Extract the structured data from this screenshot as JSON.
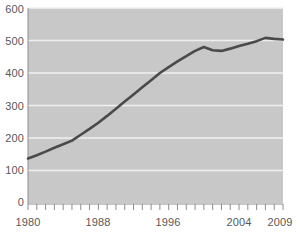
{
  "chart_data": {
    "type": "line",
    "title": "",
    "subtitle": "",
    "xlabel": "",
    "ylabel": "",
    "xlim": [
      1980,
      2009
    ],
    "ylim": [
      0,
      600
    ],
    "grid": true,
    "grid_axis": "y",
    "legend": false,
    "legend_position": "none",
    "plot_background": "#c8c8c8",
    "line_color": "#4a4a4a",
    "grid_color": "#f0f0f0",
    "axis_color": "#8c8c8c",
    "text_color": "#58585a",
    "x": [
      1980,
      1981,
      1982,
      1983,
      1984,
      1985,
      1986,
      1987,
      1988,
      1989,
      1990,
      1991,
      1992,
      1993,
      1994,
      1995,
      1996,
      1997,
      1998,
      1999,
      2000,
      2001,
      2002,
      2003,
      2004,
      2005,
      2006,
      2007,
      2008,
      2009
    ],
    "values": [
      137,
      147,
      158,
      170,
      181,
      192,
      210,
      228,
      247,
      268,
      290,
      312,
      334,
      356,
      378,
      400,
      418,
      436,
      452,
      468,
      480,
      470,
      468,
      475,
      483,
      490,
      498,
      508,
      505,
      503
    ],
    "series": [
      {
        "name": "series-1",
        "values": [
          137,
          147,
          158,
          170,
          181,
          192,
          210,
          228,
          247,
          268,
          290,
          312,
          334,
          356,
          378,
          400,
          418,
          436,
          452,
          468,
          480,
          470,
          468,
          475,
          483,
          490,
          498,
          508,
          505,
          503
        ]
      }
    ],
    "y_ticks": [
      0,
      100,
      200,
      300,
      400,
      500,
      600
    ],
    "y_tick_labels": [
      "0",
      "100",
      "200",
      "300",
      "400",
      "500",
      "600"
    ],
    "x_ticks": [
      1980,
      1981,
      1982,
      1983,
      1984,
      1985,
      1986,
      1987,
      1988,
      1989,
      1990,
      1991,
      1992,
      1993,
      1994,
      1995,
      1996,
      1997,
      1998,
      1999,
      2000,
      2001,
      2002,
      2003,
      2004,
      2005,
      2006,
      2007,
      2008,
      2009
    ],
    "x_tick_labels_shown": [
      "1980",
      "1988",
      "1996",
      "2004",
      "2009"
    ],
    "x_tick_labels_shown_at": [
      1980,
      1988,
      1996,
      2004,
      2009
    ]
  },
  "axes": {
    "y_labels": [
      "600",
      "500",
      "400",
      "300",
      "200",
      "100",
      "0"
    ],
    "x_labels": [
      "1980",
      "1988",
      "1996",
      "2004",
      "2009"
    ]
  }
}
